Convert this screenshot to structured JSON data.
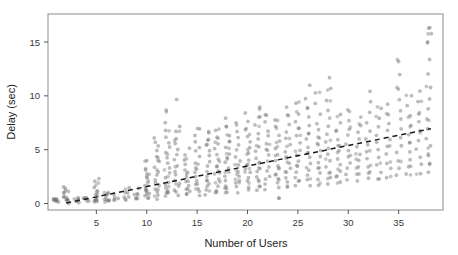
{
  "chart_data": {
    "type": "scatter",
    "title": "",
    "xlabel": "Number of Users",
    "ylabel": "Delay (sec)",
    "xlim": [
      0.2,
      39.4
    ],
    "ylim": [
      -0.6,
      17.6
    ],
    "xticks": [
      5,
      10,
      15,
      20,
      25,
      30,
      35
    ],
    "xtick_labels": [
      "5",
      "10",
      "15",
      "20",
      "25",
      "30",
      "35"
    ],
    "yticks": [
      0,
      5,
      10,
      15
    ],
    "ytick_labels": [
      "0",
      "5",
      "10",
      "15"
    ],
    "grid": false,
    "legend": "none",
    "point_color": "#6b6b6b",
    "point_opacity": 0.45,
    "point_radius": 1.9,
    "frame_color": "#8c8c8c",
    "trendline": {
      "style": "dashed",
      "color": "#1a1a1a",
      "x": [
        2.0,
        38.2
      ],
      "y": [
        0.05,
        6.95
      ],
      "slope": 0.19,
      "intercept": -0.33
    },
    "columns": [
      {
        "x": 1,
        "values": [
          0.1,
          0.2,
          0.3,
          0.3,
          0.4,
          0.5
        ]
      },
      {
        "x": 2,
        "values": [
          0.1,
          0.2,
          0.3,
          0.4,
          0.5,
          0.7,
          0.9,
          1.1,
          1.3,
          1.5
        ]
      },
      {
        "x": 3,
        "values": [
          0.1,
          0.2,
          0.3,
          0.4,
          0.5
        ]
      },
      {
        "x": 4,
        "values": [
          0.2,
          0.3,
          0.4,
          0.5,
          0.6
        ]
      },
      {
        "x": 5,
        "values": [
          0.2,
          0.3,
          0.5,
          0.7,
          0.9,
          1.2,
          1.6,
          2.0,
          2.4
        ]
      },
      {
        "x": 6,
        "values": [
          0.2,
          0.3,
          0.4,
          0.6,
          0.8,
          1.0
        ]
      },
      {
        "x": 7,
        "values": [
          0.3,
          0.4,
          0.6,
          0.8
        ]
      },
      {
        "x": 8,
        "values": [
          0.3,
          0.5,
          0.7,
          0.9,
          1.1,
          1.4
        ]
      },
      {
        "x": 9,
        "values": [
          0.4,
          0.6,
          0.8,
          1.0,
          1.3
        ]
      },
      {
        "x": 10,
        "values": [
          0.5,
          0.7,
          0.9,
          1.1,
          1.4,
          1.7,
          2.0,
          2.4,
          2.8,
          3.2,
          3.9
        ]
      },
      {
        "x": 11,
        "values": [
          0.5,
          0.8,
          1.0,
          1.3,
          1.6,
          1.9,
          2.2,
          2.6,
          3.0,
          3.4,
          3.9,
          4.4,
          4.9,
          5.3,
          5.7,
          6.1
        ]
      },
      {
        "x": 12,
        "values": [
          0.6,
          0.9,
          1.1,
          1.4,
          1.7,
          2.0,
          2.4,
          2.8,
          3.2,
          3.7,
          4.2,
          4.7,
          5.2,
          5.7,
          6.2,
          6.8,
          7.6,
          8.6
        ]
      },
      {
        "x": 13,
        "values": [
          0.7,
          1.0,
          1.3,
          1.6,
          1.9,
          2.2,
          2.6,
          3.0,
          3.5,
          4.0,
          4.5,
          5.0,
          5.5,
          6.0,
          6.6,
          7.2,
          9.6
        ]
      },
      {
        "x": 14,
        "values": [
          0.8,
          1.1,
          1.4,
          1.7,
          2.0,
          2.4,
          2.8,
          3.2,
          3.7,
          4.1,
          4.6,
          5.1
        ]
      },
      {
        "x": 15,
        "values": [
          0.8,
          1.1,
          1.4,
          1.8,
          2.1,
          2.5,
          2.9,
          3.3,
          3.8,
          4.3,
          4.8,
          5.3,
          5.8,
          6.4,
          7.0
        ]
      },
      {
        "x": 16,
        "values": [
          0.9,
          1.2,
          1.5,
          1.9,
          2.2,
          2.6,
          3.0,
          3.4,
          3.9,
          4.4,
          4.9,
          5.4,
          6.0,
          6.6
        ]
      },
      {
        "x": 17,
        "values": [
          1.0,
          1.3,
          1.6,
          2.0,
          2.3,
          2.7,
          3.1,
          3.5,
          4.0,
          4.5,
          5.0,
          5.6,
          6.2,
          6.9
        ]
      },
      {
        "x": 18,
        "values": [
          1.0,
          1.4,
          1.7,
          2.1,
          2.5,
          2.9,
          3.3,
          3.8,
          4.2,
          4.7,
          5.2,
          5.8,
          6.4,
          7.1,
          7.9
        ]
      },
      {
        "x": 19,
        "values": [
          1.1,
          1.5,
          1.9,
          2.2,
          2.6,
          3.0,
          3.5,
          3.9,
          4.4,
          4.9,
          5.5,
          6.1,
          6.7,
          7.4
        ]
      },
      {
        "x": 20,
        "values": [
          1.2,
          1.6,
          2.0,
          2.4,
          2.8,
          3.2,
          3.6,
          4.1,
          4.6,
          5.1,
          5.7,
          6.3,
          6.9,
          7.6,
          8.4
        ]
      },
      {
        "x": 21,
        "values": [
          1.3,
          1.7,
          2.1,
          2.5,
          2.9,
          3.3,
          3.8,
          4.3,
          4.8,
          5.3,
          5.9,
          6.5,
          7.2,
          8.0,
          8.9
        ]
      },
      {
        "x": 22,
        "values": [
          1.3,
          1.8,
          2.2,
          2.6,
          3.1,
          3.5,
          4.0,
          4.5,
          5.0,
          5.6,
          6.2,
          6.8,
          7.5,
          8.3
        ]
      },
      {
        "x": 23,
        "values": [
          0.6,
          1.4,
          1.9,
          2.3,
          2.7,
          3.2,
          3.6,
          4.1,
          4.6,
          5.2,
          5.8,
          6.4,
          7.1,
          7.8
        ]
      },
      {
        "x": 24,
        "values": [
          1.5,
          2.0,
          2.4,
          2.9,
          3.3,
          3.8,
          4.3,
          4.8,
          5.4,
          6.0,
          6.6,
          7.3,
          8.1,
          9.0
        ]
      },
      {
        "x": 25,
        "values": [
          1.6,
          2.1,
          2.5,
          3.0,
          3.5,
          4.0,
          4.5,
          5.0,
          5.6,
          6.2,
          6.9,
          7.6,
          8.4,
          9.3
        ]
      },
      {
        "x": 26,
        "values": [
          1.7,
          2.2,
          2.7,
          3.2,
          3.7,
          4.2,
          4.7,
          5.3,
          5.9,
          6.5,
          7.2,
          8.0,
          8.8,
          9.8,
          11.0
        ]
      },
      {
        "x": 27,
        "values": [
          1.8,
          2.3,
          2.8,
          3.3,
          3.8,
          4.4,
          4.9,
          5.5,
          6.1,
          6.8,
          7.5,
          8.3,
          9.2,
          10.2
        ]
      },
      {
        "x": 28,
        "values": [
          1.9,
          2.4,
          2.9,
          3.5,
          4.0,
          4.6,
          5.2,
          5.8,
          6.4,
          7.1,
          7.9,
          8.7,
          9.6,
          10.6,
          11.7
        ]
      },
      {
        "x": 29,
        "values": [
          2.0,
          2.5,
          3.1,
          3.6,
          4.2,
          4.8,
          5.4,
          6.0,
          6.7,
          7.4,
          8.2
        ]
      },
      {
        "x": 30,
        "values": [
          2.1,
          2.7,
          3.2,
          3.8,
          4.4,
          5.0,
          5.6,
          6.3,
          7.0,
          7.8,
          8.6
        ]
      },
      {
        "x": 31,
        "values": [
          2.2,
          2.8,
          3.4,
          4.0,
          4.6,
          5.2,
          5.9,
          6.6,
          7.3,
          8.1
        ]
      },
      {
        "x": 32,
        "values": [
          2.3,
          2.9,
          3.5,
          4.1,
          4.8,
          5.4,
          6.1,
          6.8,
          7.6,
          8.4,
          9.4,
          10.5
        ]
      },
      {
        "x": 33,
        "values": [
          2.4,
          3.0,
          3.7,
          4.3,
          5.0,
          5.7,
          6.4,
          7.2,
          8.0,
          8.9
        ]
      },
      {
        "x": 34,
        "values": [
          2.5,
          3.2,
          3.8,
          4.5,
          5.2,
          5.9,
          6.7,
          7.5,
          8.3,
          9.2
        ]
      },
      {
        "x": 35,
        "values": [
          2.6,
          3.3,
          4.0,
          4.7,
          5.4,
          6.2,
          7.0,
          7.8,
          8.7,
          9.6,
          10.7,
          11.9,
          13.3
        ]
      },
      {
        "x": 36,
        "values": [
          2.7,
          3.4,
          4.1,
          4.9,
          5.6,
          6.4,
          7.2,
          8.1,
          9.0,
          10.0
        ]
      },
      {
        "x": 37,
        "values": [
          2.8,
          3.6,
          4.3,
          5.1,
          5.9,
          6.7,
          7.5,
          8.4,
          9.4,
          10.4
        ]
      },
      {
        "x": 38,
        "values": [
          2.9,
          3.7,
          4.5,
          5.3,
          6.1,
          6.9,
          7.8,
          8.7,
          9.7,
          10.8,
          12.0,
          13.4,
          15.0,
          15.8,
          16.4
        ]
      }
    ]
  }
}
